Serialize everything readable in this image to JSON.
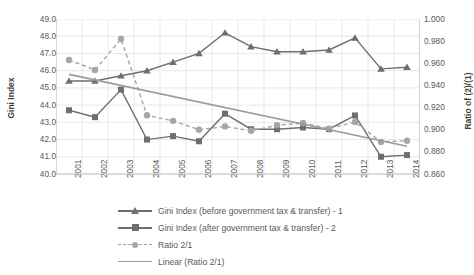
{
  "chart_data": {
    "type": "line",
    "title": "",
    "xlabel": "",
    "ylabel": "Gini Index",
    "y2label": "Ratio of (2)/(1)",
    "categories": [
      "2001",
      "2002",
      "2003",
      "2004",
      "2005",
      "2006",
      "2007",
      "2008",
      "2009",
      "2010",
      "2011",
      "2012",
      "2013",
      "2014"
    ],
    "ylim": [
      40.0,
      49.0
    ],
    "yticks": [
      "49.0",
      "48.0",
      "47.0",
      "46.0",
      "45.0",
      "44.0",
      "43.0",
      "42.0",
      "41.0",
      "40.0"
    ],
    "y2lim": [
      0.86,
      1.0
    ],
    "y2ticks": [
      "1.000",
      "0.980",
      "0.960",
      "0.940",
      "0.920",
      "0.900",
      "0.880",
      "0.860"
    ],
    "grid": true,
    "legend_position": "bottom",
    "series": [
      {
        "name": "Gini Index (before government tax & transfer) - 1",
        "axis": "left",
        "marker": "triangle",
        "style": "solid",
        "color": "#6e6e6e",
        "values": [
          45.4,
          45.4,
          45.7,
          46.0,
          46.5,
          47.0,
          48.2,
          47.4,
          47.1,
          47.1,
          47.2,
          47.9,
          46.1,
          46.2
        ]
      },
      {
        "name": "Gini Index (after government tax & transfer) - 2",
        "axis": "left",
        "marker": "square",
        "style": "solid",
        "color": "#6e6e6e",
        "values": [
          43.7,
          43.3,
          44.9,
          42.0,
          42.2,
          41.9,
          43.5,
          42.6,
          42.6,
          42.7,
          42.6,
          43.4,
          41.0,
          41.1
        ]
      },
      {
        "name": "Ratio 2/1",
        "axis": "right",
        "marker": "circle",
        "style": "dashed",
        "color": "#a6a6a6",
        "values": [
          0.963,
          0.954,
          0.982,
          0.913,
          0.908,
          0.9,
          0.903,
          0.899,
          0.904,
          0.906,
          0.901,
          0.907,
          0.889,
          0.89
        ]
      },
      {
        "name": "Linear (Ratio 2/1)",
        "axis": "right",
        "marker": "none",
        "style": "solid",
        "color": "#9b9b9b",
        "values": [
          0.95,
          0.945,
          0.94,
          0.935,
          0.93,
          0.925,
          0.92,
          0.915,
          0.91,
          0.905,
          0.9,
          0.895,
          0.89,
          0.885
        ]
      }
    ]
  },
  "legend": {
    "items": [
      {
        "label": "Gini Index (before government tax & transfer) - 1"
      },
      {
        "label": "Gini Index (after government tax & transfer) - 2"
      },
      {
        "label": "Ratio 2/1"
      },
      {
        "label": "Linear (Ratio 2/1)"
      }
    ]
  },
  "colors": {
    "series_dark": "#6e6e6e",
    "series_light": "#a6a6a6",
    "trend": "#9b9b9b",
    "grid": "#e2e2e2",
    "axis": "#b8b8b8",
    "text": "#595959"
  }
}
